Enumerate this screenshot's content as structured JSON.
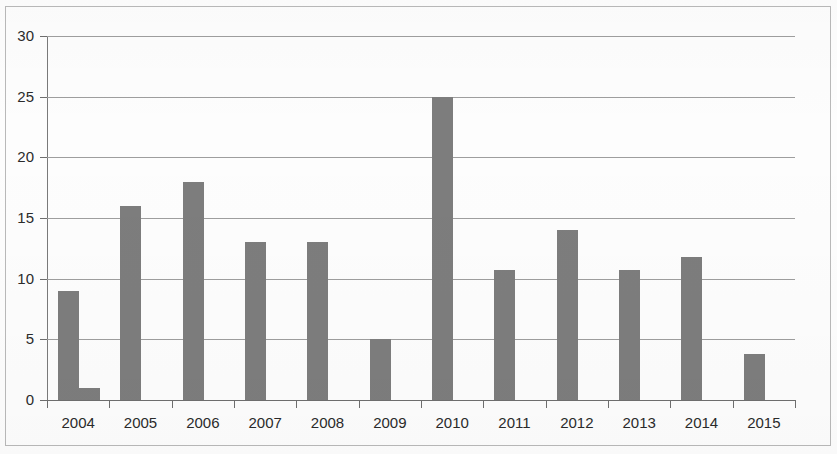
{
  "chart_data": {
    "type": "bar",
    "title": "",
    "subtitle": "",
    "xlabel": "",
    "ylabel": "",
    "ylim": [
      0,
      30
    ],
    "y_ticks": [
      0,
      5,
      10,
      15,
      20,
      25,
      30
    ],
    "grid": true,
    "legend": "none",
    "categories": [
      "2004",
      "2005",
      "2006",
      "2007",
      "2008",
      "2009",
      "2010",
      "2011",
      "2012",
      "2013",
      "2014",
      "2015"
    ],
    "series": [
      {
        "name": "Series 1",
        "color": "#7d7d7d",
        "values": [
          9,
          16,
          18,
          13,
          13,
          5,
          25,
          10.7,
          14,
          10.7,
          11.8,
          3.8
        ]
      },
      {
        "name": "Series 2",
        "color": "#7d7d7d",
        "values": [
          1,
          null,
          null,
          null,
          null,
          null,
          null,
          null,
          null,
          null,
          null,
          null
        ]
      }
    ]
  },
  "axis": {
    "y_tick_labels": [
      "0",
      "5",
      "10",
      "15",
      "20",
      "25",
      "30"
    ],
    "x_tick_labels": [
      "2004",
      "2005",
      "2006",
      "2007",
      "2008",
      "2009",
      "2010",
      "2011",
      "2012",
      "2013",
      "2014",
      "2015"
    ]
  },
  "style": {
    "bar_color": "#7d7d7d",
    "gridline_color": "#9e9e9e",
    "axis_color": "#6e6e6e",
    "background": "#fdfdfd",
    "border_color": "#b9b9b9",
    "text_color": "#2b2b2b"
  }
}
